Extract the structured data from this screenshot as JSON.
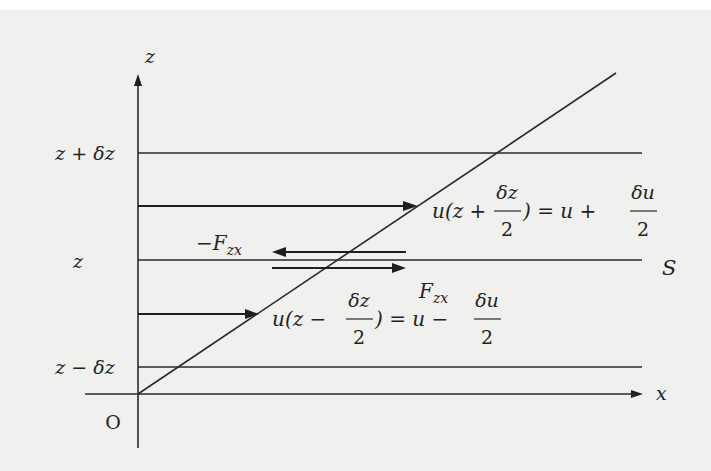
{
  "figure": {
    "background_color": "#f0f0ef",
    "line_color": "#222222",
    "axes": {
      "z_axis_label": "z",
      "x_axis_label": "x",
      "origin_label": "O"
    },
    "level_labels": {
      "upper": "z + δz",
      "middle": "z",
      "lower": "z − δz"
    },
    "plane_label": "S",
    "forces": {
      "upper_force": "−F",
      "upper_force_sub": "zx",
      "lower_force": "F",
      "lower_force_sub": "zx"
    },
    "velocity_upper": {
      "lhs_prefix": "u(z +",
      "lhs_frac_num": "δz",
      "lhs_frac_den": "2",
      "lhs_suffix": ") = u +",
      "rhs_frac_num": "δu",
      "rhs_frac_den": "2"
    },
    "velocity_lower": {
      "lhs_prefix": "u(z −",
      "lhs_frac_num": "δz",
      "lhs_frac_den": "2",
      "lhs_suffix": ") = u −",
      "rhs_frac_num": "δu",
      "rhs_frac_den": "2"
    }
  }
}
